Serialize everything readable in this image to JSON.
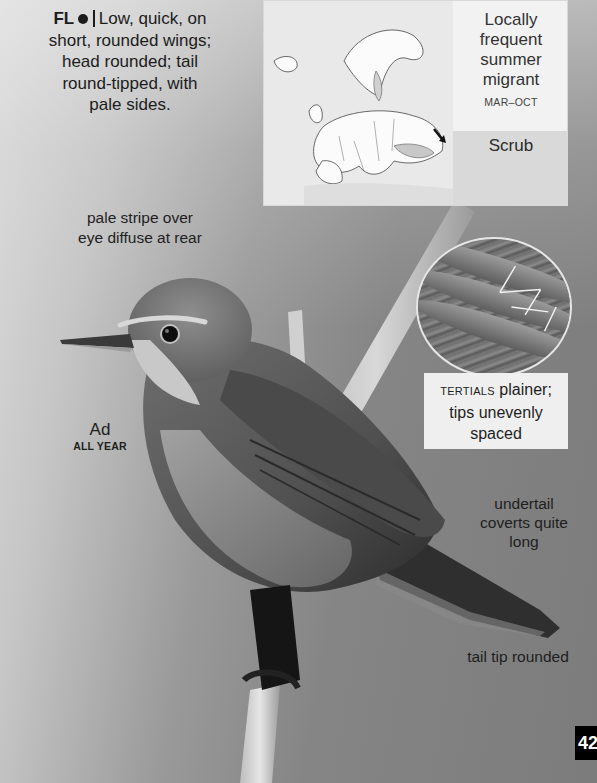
{
  "page": {
    "page_number": "42"
  },
  "flight": {
    "label": "FL",
    "separator_icon": "filled-circle",
    "lines": [
      "Low, quick, on",
      "short, rounded wings;",
      "head rounded; tail",
      "round-tipped, with",
      "pale sides."
    ]
  },
  "range_map": {
    "region": "Europe",
    "status_lines": [
      "Locally",
      "frequent",
      "summer",
      "migrant"
    ],
    "months": "MAR–OCT",
    "habitat": "Scrub"
  },
  "annotations": {
    "eye_stripe": [
      "pale stripe over",
      "eye diffuse at rear"
    ],
    "age": "Ad",
    "season": "ALL YEAR",
    "undertail": [
      "undertail",
      "coverts quite",
      "long"
    ],
    "tail_tip": "tail tip rounded"
  },
  "inset": {
    "subject": "tertials close-up",
    "label_smallcaps": "TERTIALS",
    "label_rest_line1": " plainer;",
    "label_line2": "tips unevenly",
    "label_line3": "spaced"
  },
  "colors": {
    "background_light": "#dcdcdc",
    "background_dark": "#7c7c7c",
    "text": "#1c1c1c",
    "panel_light": "#f2f2f2",
    "panel_mid": "#d9d9d9",
    "page_tab": "#000000"
  }
}
